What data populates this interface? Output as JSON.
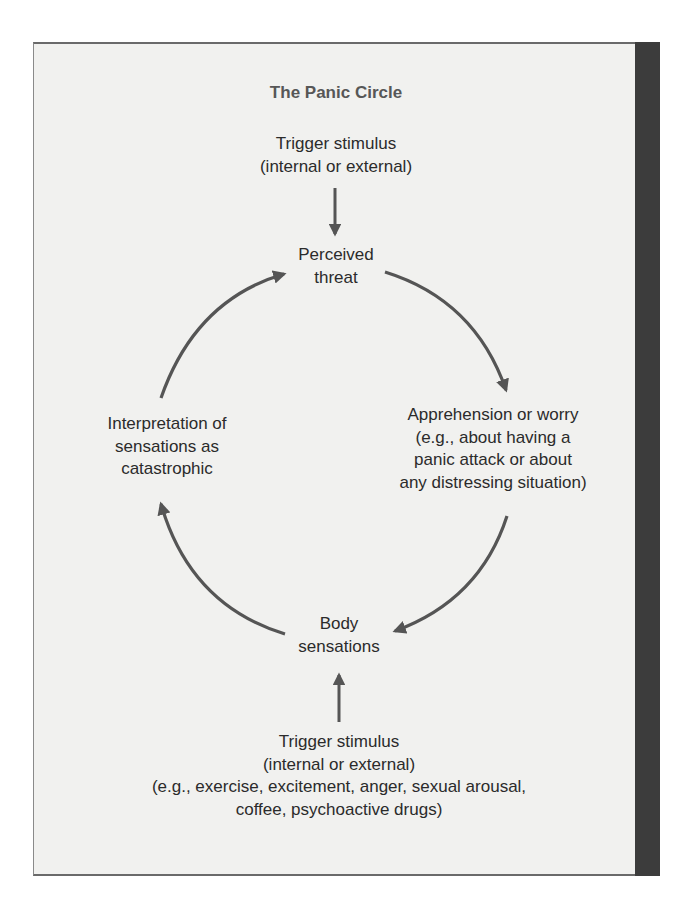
{
  "diagram": {
    "title": "The Panic Circle",
    "nodes": {
      "trigger_top": {
        "lines": [
          "Trigger stimulus",
          "(internal or external)"
        ]
      },
      "perceived_threat": {
        "lines": [
          "Perceived",
          "threat"
        ]
      },
      "apprehension": {
        "lines": [
          "Apprehension or worry",
          "(e.g., about having a",
          "panic attack or about",
          "any distressing situation)"
        ]
      },
      "body_sensations": {
        "lines": [
          "Body",
          "sensations"
        ]
      },
      "interpretation": {
        "lines": [
          "Interpretation of",
          "sensations as",
          "catastrophic"
        ]
      },
      "trigger_bottom": {
        "lines": [
          "Trigger stimulus",
          "(internal or external)",
          "(e.g., exercise, excitement, anger, sexual arousal,",
          "coffee, psychoactive drugs)"
        ]
      }
    },
    "edges": [
      {
        "from": "trigger_top",
        "to": "perceived_threat",
        "shape": "straight-down-arrow"
      },
      {
        "from": "perceived_threat",
        "to": "apprehension",
        "shape": "curved-arrow"
      },
      {
        "from": "apprehension",
        "to": "body_sensations",
        "shape": "curved-arrow"
      },
      {
        "from": "body_sensations",
        "to": "interpretation",
        "shape": "curved-arrow"
      },
      {
        "from": "interpretation",
        "to": "perceived_threat",
        "shape": "curved-arrow"
      },
      {
        "from": "trigger_bottom",
        "to": "body_sensations",
        "shape": "straight-up-arrow"
      }
    ],
    "colors": {
      "panel_bg": "#f1f1ef",
      "sidebar": "#3c3c3c",
      "arrow": "#555555",
      "text": "#2b2b2b",
      "title": "#575757"
    }
  }
}
